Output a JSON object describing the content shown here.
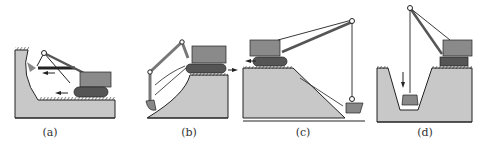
{
  "panels": [
    {
      "id": "a",
      "label": "(a)",
      "description": "shovel excavating face above track level"
    },
    {
      "id": "b",
      "label": "(b)",
      "description": "backhoe excavating slope below track level"
    },
    {
      "id": "c",
      "label": "(c)",
      "description": "dragline excavating down slope"
    },
    {
      "id": "d",
      "label": "(d)",
      "description": "clamshell excavating trench"
    }
  ],
  "colors": {
    "soil": "#c8c8c8",
    "machine": "#8a8a8a",
    "track": "#555555",
    "line": "#222222"
  }
}
